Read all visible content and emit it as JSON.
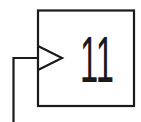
{
  "diagram": {
    "type": "edge-triggered-block",
    "block": {
      "label": "11"
    },
    "clock_input": {
      "symbol": "triangle"
    },
    "colors": {
      "stroke": "#1a1a1a",
      "background": "#ffffff"
    }
  }
}
